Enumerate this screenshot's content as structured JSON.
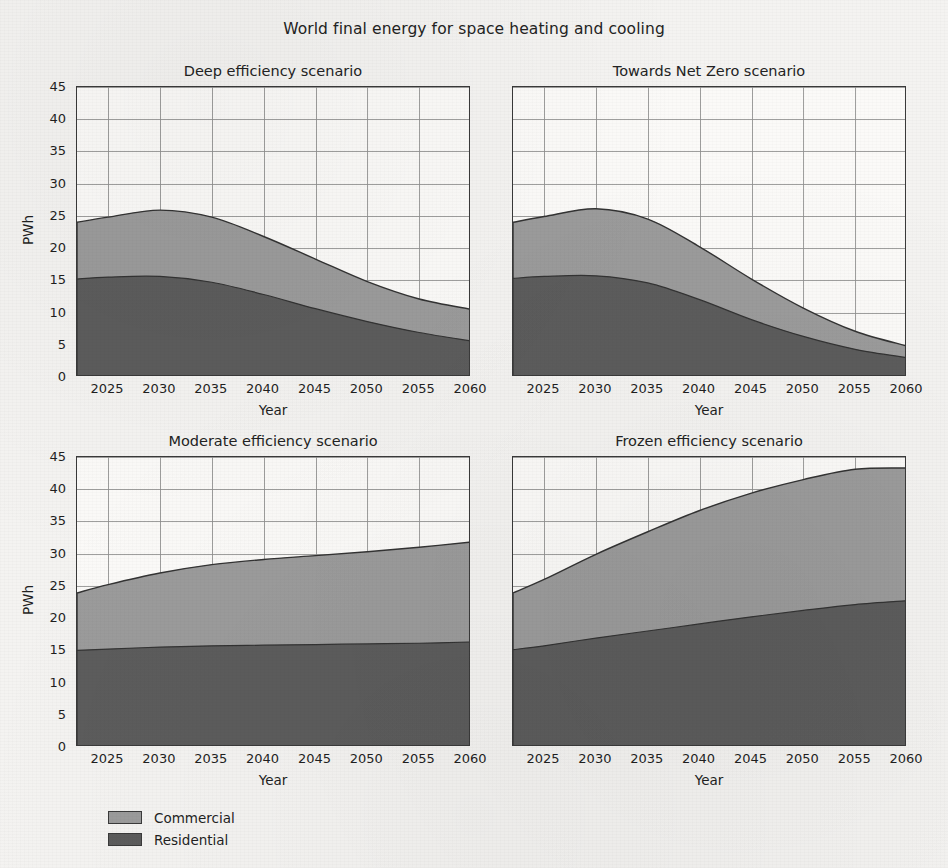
{
  "figure": {
    "title": "World final energy for space heating and cooling"
  },
  "axes": {
    "ylabel": "PWh",
    "xlabel": "Year",
    "yticks": [
      0,
      5,
      10,
      15,
      20,
      25,
      30,
      35,
      40,
      45
    ],
    "xticks": [
      2025,
      2030,
      2035,
      2040,
      2045,
      2050,
      2055,
      2060
    ],
    "ylim": [
      0,
      45
    ],
    "xlim": [
      2022,
      2060
    ],
    "grid": true
  },
  "legend": {
    "position": "lower-left-outside",
    "entries": [
      {
        "label": "Commercial",
        "color": "#9b9b9b"
      },
      {
        "label": "Residential",
        "color": "#5c5c5c"
      }
    ]
  },
  "colors": {
    "commercial": "#9b9b9b",
    "residential": "#5c5c5c",
    "edge": "#333333",
    "grid": "#8e8e8e",
    "background": "#f4f3f1",
    "plot_background": "#fbfaf8"
  },
  "chart_data": {
    "type": "area",
    "stacked": true,
    "title": "World final energy for space heating and cooling",
    "xlabel": "Year",
    "ylabel": "PWh",
    "ylim": [
      0,
      45
    ],
    "xlim": [
      2022,
      2060
    ],
    "x": [
      2022,
      2025,
      2030,
      2035,
      2040,
      2045,
      2050,
      2055,
      2060
    ],
    "panels": [
      {
        "title": "Deep efficiency scenario",
        "series": [
          {
            "name": "Residential",
            "values": [
              15.2,
              15.5,
              15.6,
              14.7,
              12.8,
              10.6,
              8.6,
              6.9,
              5.6
            ]
          },
          {
            "name": "Commercial",
            "values": [
              8.8,
              9.3,
              10.3,
              10.1,
              9.0,
              7.7,
              6.2,
              5.2,
              4.9
            ]
          }
        ],
        "totals": [
          24.0,
          24.8,
          25.9,
          24.8,
          21.8,
          18.3,
          14.8,
          12.1,
          10.5
        ]
      },
      {
        "title": "Towards Net Zero scenario",
        "series": [
          {
            "name": "Residential",
            "values": [
              15.3,
              15.6,
              15.7,
              14.6,
              12.0,
              8.9,
              6.3,
              4.3,
              3.0
            ]
          },
          {
            "name": "Commercial",
            "values": [
              8.7,
              9.3,
              10.4,
              9.9,
              8.2,
              6.3,
              4.4,
              2.8,
              1.8
            ]
          }
        ],
        "totals": [
          24.0,
          24.9,
          26.1,
          24.5,
          20.2,
          15.2,
          10.7,
          7.1,
          4.8
        ]
      },
      {
        "title": "Moderate efficiency scenario",
        "series": [
          {
            "name": "Residential",
            "values": [
              15.0,
              15.2,
              15.5,
              15.7,
              15.8,
              15.9,
              16.0,
              16.1,
              16.3
            ]
          },
          {
            "name": "Commercial",
            "values": [
              8.9,
              10.0,
              11.5,
              12.6,
              13.3,
              13.8,
              14.3,
              14.9,
              15.5
            ]
          }
        ],
        "totals": [
          23.9,
          25.2,
          27.0,
          28.3,
          29.1,
          29.7,
          30.3,
          31.0,
          31.8
        ]
      },
      {
        "title": "Frozen efficiency scenario",
        "series": [
          {
            "name": "Residential",
            "values": [
              15.1,
              15.7,
              16.9,
              18.0,
              19.1,
              20.2,
              21.2,
              22.1,
              22.7
            ]
          },
          {
            "name": "Commercial",
            "values": [
              8.8,
              10.3,
              13.0,
              15.4,
              17.6,
              19.2,
              20.3,
              21.0,
              20.6
            ]
          }
        ],
        "totals": [
          23.9,
          26.0,
          29.9,
          33.4,
          36.7,
          39.4,
          41.5,
          43.1,
          43.3
        ]
      }
    ]
  }
}
